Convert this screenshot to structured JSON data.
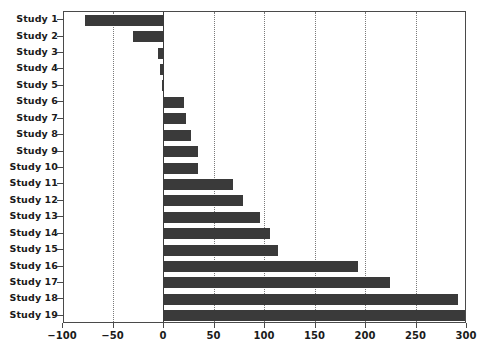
{
  "chart_data": {
    "type": "bar",
    "orientation": "horizontal",
    "title": "",
    "xlabel": "",
    "ylabel": "",
    "xlim": [
      -100,
      300
    ],
    "xticks": [
      -100,
      -50,
      0,
      50,
      100,
      150,
      200,
      250,
      300
    ],
    "xtick_labels": [
      "-100",
      "-50",
      "0",
      "50",
      "100",
      "150",
      "200",
      "250",
      "300"
    ],
    "grid": "vertical-dotted",
    "legend": "none",
    "bar_color": "#3a3a3a",
    "categories": [
      "Study 1",
      "Study 2",
      "Study 3",
      "Study 4",
      "Study 5",
      "Study 6",
      "Study 7",
      "Study 8",
      "Study 9",
      "Study 10",
      "Study 11",
      "Study 12",
      "Study 13",
      "Study 14",
      "Study 15",
      "Study 16",
      "Study 17",
      "Study 18",
      "Study 19"
    ],
    "values": [
      -78,
      -31,
      -6,
      -4,
      -2,
      20,
      22,
      27,
      34,
      34,
      68,
      78,
      95,
      105,
      113,
      192,
      224,
      291,
      306
    ]
  }
}
